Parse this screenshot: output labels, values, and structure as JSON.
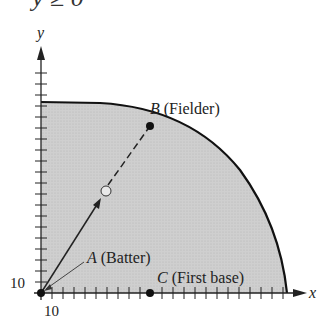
{
  "header": {
    "condition_text": "y ≥ 0"
  },
  "axes": {
    "x_label": "x",
    "y_label": "y",
    "x_tick_label": "10",
    "y_tick_label": "10"
  },
  "points": {
    "A": {
      "letter": "A",
      "desc": " (Batter)"
    },
    "B": {
      "letter": "B",
      "desc": " (Fielder)"
    },
    "C": {
      "letter": "C",
      "desc": " (First base)"
    }
  },
  "colors": {
    "region_fill": "#c8c8c8",
    "ink": "#1a1a1a"
  }
}
